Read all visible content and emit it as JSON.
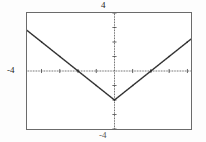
{
  "figure": {
    "problem_label": ")"
  },
  "labels": {
    "y_max": "4",
    "y_min": "-4",
    "x_min": "-4"
  },
  "colors": {
    "frame": "#6b6b6b",
    "axis": "#3a3a3a",
    "curve": "#2a2a2a",
    "background": "#ffffff"
  },
  "chart_data": {
    "type": "line",
    "title": "",
    "xlabel": "",
    "ylabel": "",
    "xlim": [
      -4.8,
      4.2
    ],
    "ylim": [
      -4.0,
      4.0
    ],
    "grid": false,
    "legend": null,
    "axis_ticks": {
      "x": [
        -4,
        -3,
        -2,
        -1,
        0,
        1,
        2,
        3,
        4
      ],
      "y": [
        -4,
        -3,
        -2,
        -1,
        0,
        1,
        2,
        3,
        4
      ],
      "tick_style": "dotted-marks-on-axis"
    },
    "tick_labels": {
      "x": [
        "-4"
      ],
      "y": [
        "4",
        "-4"
      ]
    },
    "series": [
      {
        "name": "y = |x| - 2",
        "style": "dotted",
        "x": [
          -4.8,
          -4.0,
          -3.0,
          -2.0,
          -1.0,
          0.0,
          1.0,
          2.0,
          3.0,
          4.0,
          4.2
        ],
        "y": [
          2.8,
          2.0,
          1.0,
          0.0,
          -1.0,
          -2.0,
          -1.0,
          0.0,
          1.0,
          2.0,
          2.2
        ]
      }
    ],
    "annotations": [
      {
        "text": "vertex",
        "x": 0,
        "y": -2
      },
      {
        "text": "x-intercept",
        "x": -2,
        "y": 0
      },
      {
        "text": "x-intercept",
        "x": 2,
        "y": 0
      }
    ]
  }
}
